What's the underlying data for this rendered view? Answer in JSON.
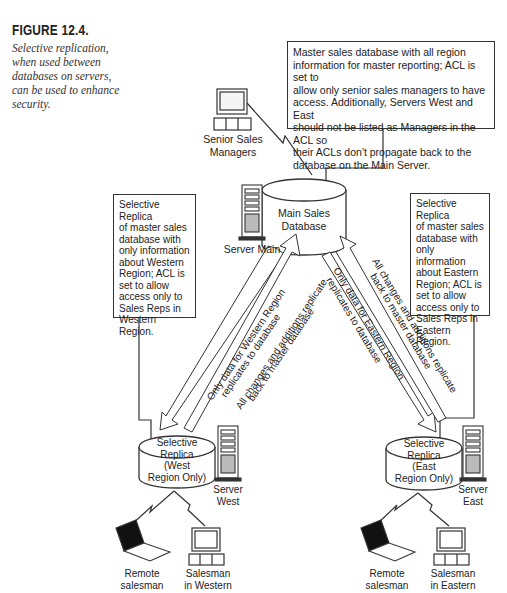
{
  "caption": {
    "title": "FIGURE 12.4.",
    "text": "Selective replication,\nwhen used between\ndatabases on servers,\ncan be used to enhance\nsecurity."
  },
  "notes": {
    "master": "Master sales database with all region\ninformation for master reporting; ACL is set to\nallow only senior sales managers to have\naccess.  Additionally, Servers West and East\nshould not be listed as Managers in the ACL so\ntheir ACLs don't propagate back to the\ndatabase on the Main Server.",
    "west": "Selective Replica\nof master sales\ndatabase with\nonly information\nabout Western\nRegion; ACL is\nset to allow\naccess only to\nSales Reps in\nWestern Region.",
    "east": "Selective Replica\nof master sales\ndatabase with\nonly information\nabout Eastern\nRegion; ACL is\nset to allow\naccess only to\nSales Reps in\nEastern Region."
  },
  "nodes": {
    "senior_managers": "Senior Sales\nManagers",
    "main_db": "Main Sales\nDatabase",
    "server_main": "Server Main",
    "west_db": "Selective\nReplica\n(West\nRegion Only)",
    "east_db": "Selective\nReplica\n(East\nRegion Only)",
    "server_west": "Server\nWest",
    "server_east": "Server\nEast",
    "remote_west": "Remote\nsalesman",
    "salesman_west": "Salesman\nin Western",
    "remote_east": "Remote\nsalesman",
    "salesman_east": "Salesman\nin Eastern"
  },
  "arrows": {
    "west_down_1": "Only data for Western Region",
    "west_down_2": "replicates to database",
    "west_up_1": "All changes and additions replicate",
    "west_up_2": "back to master database",
    "east_down_1": "Only data for Eastern Region",
    "east_down_2": "replicates to database",
    "east_up_1": "All changes and additions replicate",
    "east_up_2": "back to master database"
  },
  "colors": {
    "line": "#333333",
    "background": "#ffffff",
    "screen": "#111111"
  }
}
